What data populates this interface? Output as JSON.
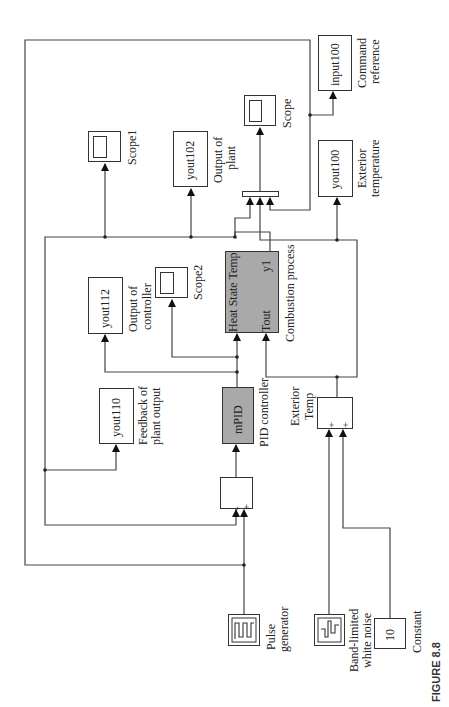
{
  "figure_label": "FIGURE 8.8",
  "orientation": "rotated 90° counter-clockwise",
  "blocks": {
    "pulse_generator": {
      "type": "source",
      "label_lines": [
        "Pulse",
        "generator"
      ]
    },
    "band_limited_white_noise": {
      "type": "source",
      "label_lines": [
        "Band-limited",
        "white noise"
      ]
    },
    "constant": {
      "type": "source",
      "value": "10",
      "label": "Constant"
    },
    "sum_error": {
      "type": "sum",
      "signs": [
        "-",
        "+"
      ]
    },
    "exterior_temp_sum": {
      "type": "sum",
      "signs": [
        "+",
        "+"
      ],
      "label_lines": [
        "Exterior",
        "Temp"
      ]
    },
    "pid_controller": {
      "type": "subsystem",
      "text": "mPID",
      "label": "PID controller",
      "color": "#a9a9a9"
    },
    "combustion_process": {
      "type": "subsystem",
      "inputs": [
        "Heat State Temp",
        "Tout"
      ],
      "output": "y1",
      "label": "Combustion process",
      "color": "#a9a9a9"
    },
    "mux": {
      "type": "mux",
      "inputs": 3
    },
    "yout110": {
      "type": "to-workspace",
      "text": "yout110",
      "label_lines": [
        "Feedback of",
        "plant output"
      ]
    },
    "yout112": {
      "type": "to-workspace",
      "text": "yout112",
      "label_lines": [
        "Output of",
        "controller"
      ]
    },
    "yout102": {
      "type": "to-workspace",
      "text": "yout102",
      "label_lines": [
        "Output of",
        "plant"
      ]
    },
    "yout100": {
      "type": "to-workspace",
      "text": "yout100",
      "label_lines": [
        "Exterior",
        "temperature"
      ]
    },
    "input100": {
      "type": "to-workspace",
      "text": "input100",
      "label_lines": [
        "Command",
        "reference"
      ]
    },
    "scope": {
      "type": "scope",
      "label": "Scope"
    },
    "scope1": {
      "type": "scope",
      "label": "Scope1"
    },
    "scope2": {
      "type": "scope",
      "label": "Scope2"
    }
  },
  "connections": [
    [
      "pulse_generator",
      "sum_error(+)"
    ],
    [
      "pulse_generator",
      "input100"
    ],
    [
      "pulse_generator",
      "mux(3)"
    ],
    [
      "combustion_process.y1",
      "sum_error(-)"
    ],
    [
      "combustion_process.y1",
      "yout110"
    ],
    [
      "combustion_process.y1",
      "scope1"
    ],
    [
      "combustion_process.y1",
      "yout102"
    ],
    [
      "combustion_process.y1",
      "mux(1)"
    ],
    [
      "sum_error",
      "pid_controller"
    ],
    [
      "pid_controller",
      "yout112"
    ],
    [
      "pid_controller",
      "scope2"
    ],
    [
      "pid_controller",
      "combustion_process.Heat State Temp"
    ],
    [
      "band_limited_white_noise",
      "exterior_temp_sum(+)"
    ],
    [
      "constant",
      "exterior_temp_sum(+)"
    ],
    [
      "exterior_temp_sum",
      "combustion_process.Tout"
    ],
    [
      "exterior_temp_sum",
      "yout100"
    ],
    [
      "exterior_temp_sum",
      "mux(2)"
    ],
    [
      "mux",
      "scope"
    ]
  ]
}
